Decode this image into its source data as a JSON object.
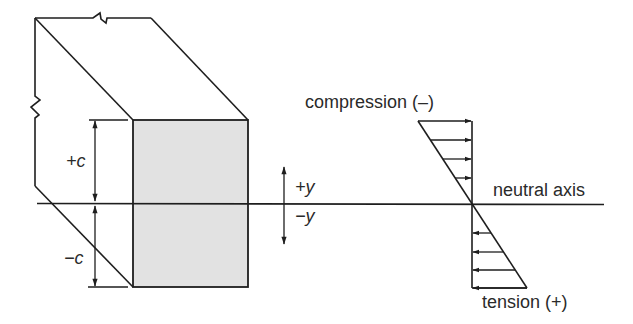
{
  "figure": {
    "type": "beam bending stress distribution",
    "colors": {
      "line": "#1e1e1e",
      "text": "#2a2a2a",
      "section_fill": "#e2e2e2",
      "background": "#ffffff"
    }
  },
  "beam": {
    "dimension_labels": {
      "upper": "+c",
      "lower": "−c"
    }
  },
  "y_axis": {
    "positive_label": "+y",
    "negative_label": "−y"
  },
  "stress_distribution": {
    "compression_label": "compression (–)",
    "tension_label": "tension (+)",
    "neutral_axis_label": "neutral axis",
    "compression_arrow_count": 4,
    "tension_arrow_count": 4
  }
}
